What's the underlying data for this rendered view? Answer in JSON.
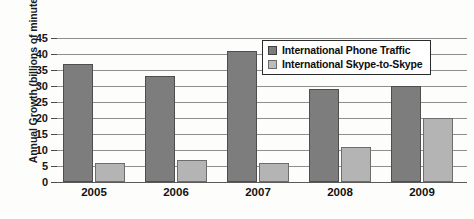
{
  "chart_data": {
    "type": "bar",
    "title": "",
    "xlabel": "",
    "ylabel": "Annual Growth (billions of minutes)",
    "categories": [
      "2005",
      "2006",
      "2007",
      "2008",
      "2009"
    ],
    "series": [
      {
        "name": "International Phone Traffic",
        "color": "#7d7d7d",
        "values": [
          37,
          33,
          41,
          29,
          30
        ]
      },
      {
        "name": "International Skype-to-Skype",
        "color": "#b4b4b4",
        "values": [
          6,
          7,
          6,
          11,
          20
        ]
      }
    ],
    "ylim": [
      0,
      45
    ],
    "yticks": [
      0,
      5,
      10,
      15,
      20,
      25,
      30,
      35,
      40,
      45
    ],
    "ytick_labels": [
      "0",
      "5",
      "10",
      "15",
      "20",
      "25",
      "30",
      "35",
      "40",
      "45"
    ],
    "grid": true,
    "legend_position": "top-right"
  }
}
